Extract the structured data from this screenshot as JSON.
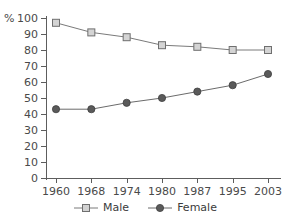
{
  "chart_data": {
    "type": "line",
    "title": "",
    "subtitle": "",
    "xlabel": "",
    "ylabel": "%",
    "ylim": [
      0,
      100
    ],
    "yticks": [
      0,
      10,
      20,
      30,
      40,
      50,
      60,
      70,
      80,
      90,
      100
    ],
    "grid": false,
    "legend_position": "bottom-center",
    "categories": [
      "1960",
      "1968",
      "1974",
      "1980",
      "1987",
      "1995",
      "2003"
    ],
    "series": [
      {
        "name": "Male",
        "marker": "open-square",
        "color": "#9a9a9a",
        "line_color": "#7a7a7a",
        "values": [
          97,
          91,
          88,
          83,
          82,
          80,
          80
        ]
      },
      {
        "name": "Female",
        "marker": "filled-circle",
        "color": "#5a5a5a",
        "line_color": "#6b6b6b",
        "values": [
          43,
          43,
          47,
          50,
          54,
          58,
          65
        ]
      }
    ]
  },
  "axis": {
    "y_unit_label": "%",
    "tick_labels_y": [
      "100",
      "90",
      "80",
      "70",
      "60",
      "50",
      "40",
      "30",
      "20",
      "10",
      "0"
    ],
    "tick_labels_x": [
      "1960",
      "1968",
      "1974",
      "1980",
      "1987",
      "1995",
      "2003"
    ]
  },
  "legend": {
    "items": [
      {
        "label": "Male",
        "marker_name": "legend-marker-open-square"
      },
      {
        "label": "Female",
        "marker_name": "legend-marker-filled-circle"
      }
    ]
  },
  "colors": {
    "axis": "#5d5d5d",
    "text": "#3b3b3b",
    "male": "#9a9a9a",
    "female": "#5a5a5a",
    "background": "#ffffff"
  }
}
